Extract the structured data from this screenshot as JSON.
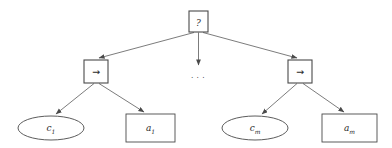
{
  "diagram": {
    "kind": "and-or-tree",
    "colors": {
      "background": "#ffffff",
      "stroke": "#4a4a4a",
      "node_fill": "#ffffff",
      "text": "#2b2b2b",
      "edge": "#5a5a5a"
    },
    "nodes": {
      "root": {
        "id": "root",
        "shape": "rectangle",
        "label": "?",
        "x": 189,
        "y": 11,
        "width": 19,
        "height": 21
      },
      "left_rule": {
        "id": "left-rule",
        "shape": "rectangle",
        "label": "→",
        "x": 84,
        "y": 60,
        "width": 24,
        "height": 23
      },
      "right_rule": {
        "id": "right-rule",
        "shape": "rectangle",
        "label": "→",
        "x": 288,
        "y": 60,
        "width": 24,
        "height": 23
      },
      "left_condition": {
        "id": "left-condition",
        "shape": "ellipse",
        "base": "c",
        "subscript": "1",
        "label": "c1",
        "cx": 51,
        "cy": 128,
        "rx": 33,
        "ry": 12
      },
      "left_action": {
        "id": "left-action",
        "shape": "rectangle",
        "base": "a",
        "subscript": "1",
        "label": "a1",
        "x": 126,
        "y": 114,
        "width": 49,
        "height": 28
      },
      "right_condition": {
        "id": "right-condition",
        "shape": "ellipse",
        "base": "c",
        "subscript": "m",
        "label": "cm",
        "cx": 255,
        "cy": 128,
        "rx": 33,
        "ry": 12
      },
      "right_action": {
        "id": "right-action",
        "shape": "rectangle",
        "base": "a",
        "subscript": "m",
        "label": "am",
        "x": 322,
        "y": 114,
        "width": 55,
        "height": 28
      },
      "ellipsis": {
        "id": "middle-ellipsis",
        "shape": "text",
        "label": "· · ·",
        "cx": 198,
        "cy": 77
      }
    },
    "edges": [
      {
        "id": "root-to-left-rule",
        "from": "root",
        "to": "left_rule"
      },
      {
        "id": "root-to-ellipsis",
        "from": "root",
        "to": "ellipsis"
      },
      {
        "id": "root-to-right-rule",
        "from": "root",
        "to": "right_rule"
      },
      {
        "id": "left-rule-to-condition",
        "from": "left_rule",
        "to": "left_condition"
      },
      {
        "id": "left-rule-to-action",
        "from": "left_rule",
        "to": "left_action"
      },
      {
        "id": "right-rule-to-condition",
        "from": "right_rule",
        "to": "right_condition"
      },
      {
        "id": "right-rule-to-action",
        "from": "right_rule",
        "to": "right_action"
      }
    ]
  }
}
